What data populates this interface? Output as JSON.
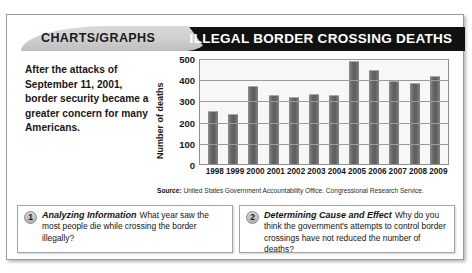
{
  "header": {
    "tab_label": "CHARTS/GRAPHS",
    "title": "ILLEGAL BORDER CROSSING DEATHS"
  },
  "intro": {
    "text": "After the attacks of September 11, 2001, border security became a greater concern for many Americans."
  },
  "source": {
    "prefix": "Source:",
    "text": " United States Government Accountability Office. Congressional Research Service."
  },
  "questions": [
    {
      "number": "1",
      "title": "Analyzing Information",
      "body": "What year saw the most people die while crossing the border illegally?"
    },
    {
      "number": "2",
      "title": "Determining Cause and Effect",
      "body": "Why do you think the government's attempts to control border crossings have not reduced the number of deaths?"
    }
  ],
  "chart_data": {
    "type": "bar",
    "title": "ILLEGAL BORDER CROSSING DEATHS",
    "xlabel": "",
    "ylabel": "Number of deaths",
    "ylim": [
      0,
      500
    ],
    "yticks": [
      0,
      100,
      200,
      300,
      400,
      500
    ],
    "grid": true,
    "legend": null,
    "categories": [
      "1998",
      "1999",
      "2000",
      "2001",
      "2002",
      "2003",
      "2004",
      "2005",
      "2006",
      "2007",
      "2008",
      "2009"
    ],
    "values": [
      250,
      235,
      370,
      325,
      318,
      330,
      325,
      485,
      445,
      390,
      380,
      415
    ],
    "source": "United States Government Accountability Office. Congressional Research Service."
  },
  "colors": {
    "header_black": "#111111",
    "header_gray": "#cfcfcf",
    "bar": "#6a6a6a",
    "grid": "#9b9b9b",
    "text": "#171717"
  }
}
